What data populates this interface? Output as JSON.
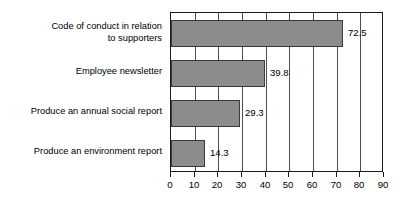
{
  "chart_data": {
    "type": "bar",
    "orientation": "horizontal",
    "title": "",
    "subtitle": "",
    "xlabel": "",
    "ylabel": "",
    "categories": [
      "Code of conduct in relation\nto supporters",
      "Employee newsletter",
      "Produce an annual social report",
      "Produce an environment report"
    ],
    "values": [
      72.5,
      39.8,
      29.3,
      14.3
    ],
    "data_labels": [
      "72.5",
      "39.8",
      "29.3",
      "14.3"
    ],
    "xlim": [
      0,
      90
    ],
    "xticks": [
      0,
      10,
      20,
      30,
      40,
      50,
      60,
      70,
      80,
      90
    ],
    "xtick_labels": [
      "0",
      "10",
      "20",
      "30",
      "40",
      "50",
      "60",
      "70",
      "80",
      "90"
    ],
    "grid": "vertical",
    "legend": "none",
    "bar_color": "#8c8c8c",
    "bar_edge_color": "#3a3a3a",
    "grid_color": "#4d4d4d",
    "axis_color": "#1a1a1a",
    "background": "#ffffff"
  }
}
